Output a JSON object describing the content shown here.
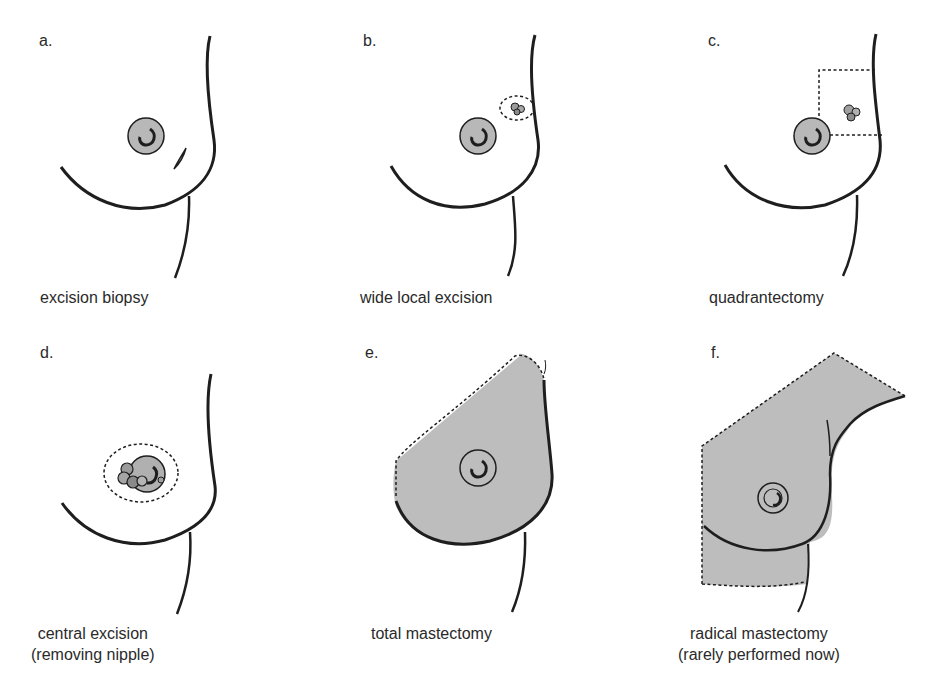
{
  "figure": {
    "panels": [
      {
        "letter": "a.",
        "caption": [
          "excision biopsy"
        ]
      },
      {
        "letter": "b.",
        "caption": [
          "wide local excision"
        ]
      },
      {
        "letter": "c.",
        "caption": [
          "quadrantectomy"
        ]
      },
      {
        "letter": "d.",
        "caption": [
          "central excision",
          "(removing nipple)"
        ]
      },
      {
        "letter": "e.",
        "caption": [
          "total mastectomy"
        ]
      },
      {
        "letter": "f.",
        "caption": [
          "radical mastectomy",
          "(rarely performed now)"
        ]
      }
    ],
    "colors": {
      "line": "#1e1e1e",
      "areola_fill": "#b8b8b8",
      "excision_fill": "#bdbdbd",
      "background": "#ffffff"
    }
  }
}
